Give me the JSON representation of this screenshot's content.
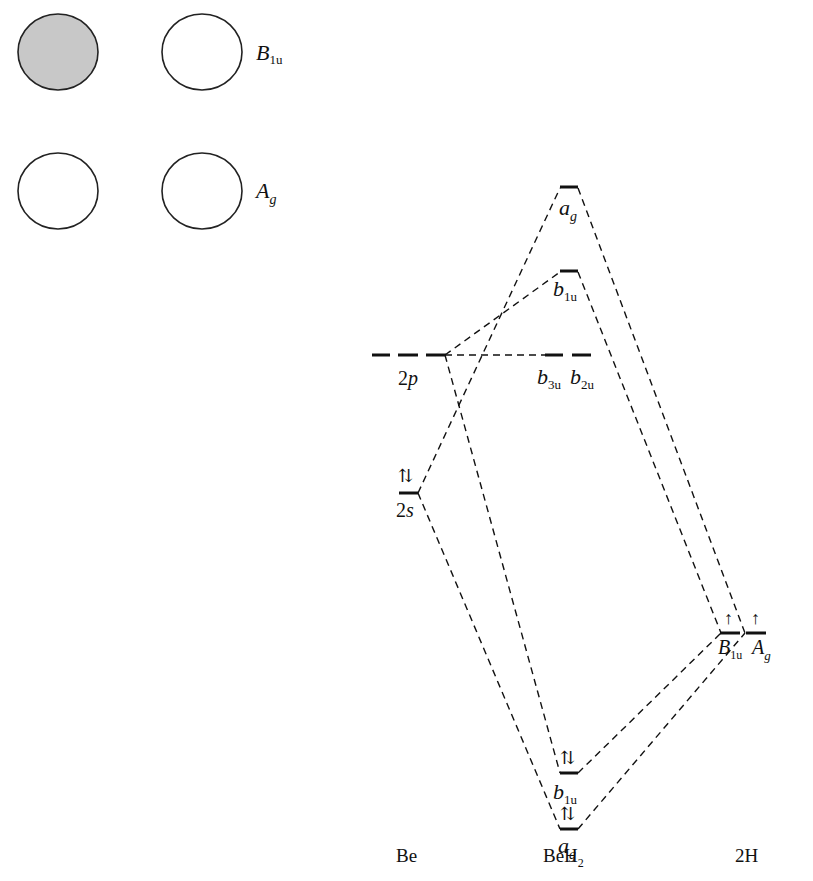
{
  "orbital_sketch": {
    "rows": [
      {
        "label_main": "B",
        "label_sub": "1u",
        "left_shaded": true,
        "fill_shaded": "#c8c8c8"
      },
      {
        "label_main": "A",
        "label_sub": "g",
        "left_shaded": false
      }
    ]
  },
  "columns": {
    "left": "Be",
    "center_main": "BeH",
    "center_sub": "2",
    "right": "2H"
  },
  "levels": {
    "be_2p": {
      "main": "2",
      "italic": "p"
    },
    "be_2s": {
      "main": "2",
      "italic": "s",
      "electrons": "⇅"
    },
    "ag_top": {
      "main": "a",
      "sub": "g"
    },
    "b1u_top": {
      "main": "b",
      "sub": "1u"
    },
    "b3u": {
      "main": "b",
      "sub": "3u"
    },
    "b2u": {
      "main": "b",
      "sub": "2u"
    },
    "b1u_bottom": {
      "main": "b",
      "sub": "1u",
      "electrons": "⇅"
    },
    "ag_bottom": {
      "main": "a",
      "sub": "g",
      "electrons": "⇅"
    },
    "h_B1u": {
      "main": "B",
      "sub": "1u",
      "electrons": "↑"
    },
    "h_Ag": {
      "main": "A",
      "sub": "g",
      "electrons": "↑"
    }
  }
}
